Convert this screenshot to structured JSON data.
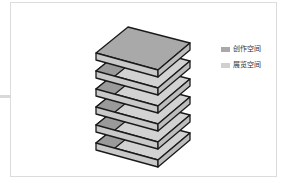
{
  "figure": {
    "layers": 6,
    "colors": {
      "top_face": "#a9a9a9",
      "inner_dark": "#9a9a9a",
      "inner_light": "#d2d2d2",
      "front_face": "#c9c9c9",
      "side_face": "#bdbdbd",
      "outline": "#1a1a1a",
      "frame": "#dcdcdc"
    }
  },
  "legend": {
    "items": [
      {
        "label": "创作空间",
        "color": "#a9a9a9"
      },
      {
        "label": "展览空间",
        "color": "#d0d0d0"
      }
    ]
  }
}
